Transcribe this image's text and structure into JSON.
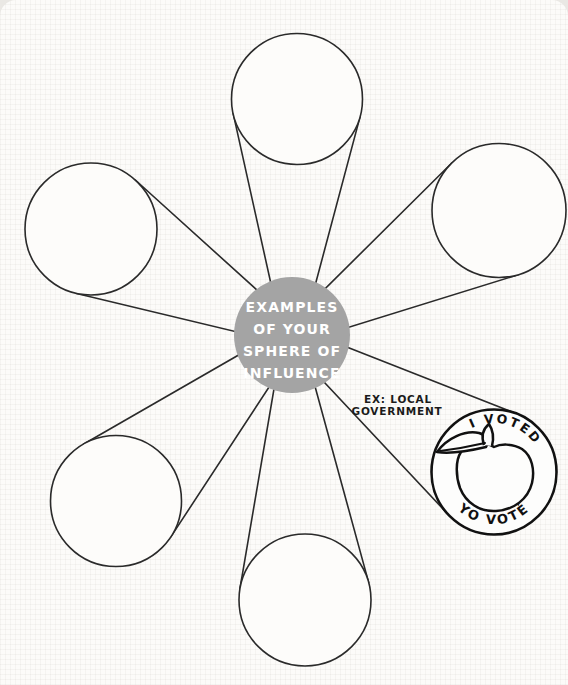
{
  "style": {
    "line_color": "#2a2a2a",
    "paper_color": "#fcfbf9",
    "hub_fill": "#a4a4a4",
    "hub_text_color": "#ffffff"
  },
  "title_circle": {
    "lines": [
      "EXAMPLES",
      "OF YOUR",
      "SPHERE OF",
      "INFLUENCE"
    ]
  },
  "nodes": [
    {
      "id": "top",
      "label": ""
    },
    {
      "id": "upper-left",
      "label": ""
    },
    {
      "id": "upper-right",
      "label": ""
    },
    {
      "id": "lower-left",
      "label": ""
    },
    {
      "id": "bottom",
      "label": ""
    }
  ],
  "example": {
    "caption_line1": "EX: LOCAL",
    "caption_line2": "GOVERNMENT",
    "sticker": {
      "arc_top": "I VOTED",
      "arc_bottom": "YO VOTÉ",
      "icon": "peach-icon"
    }
  }
}
